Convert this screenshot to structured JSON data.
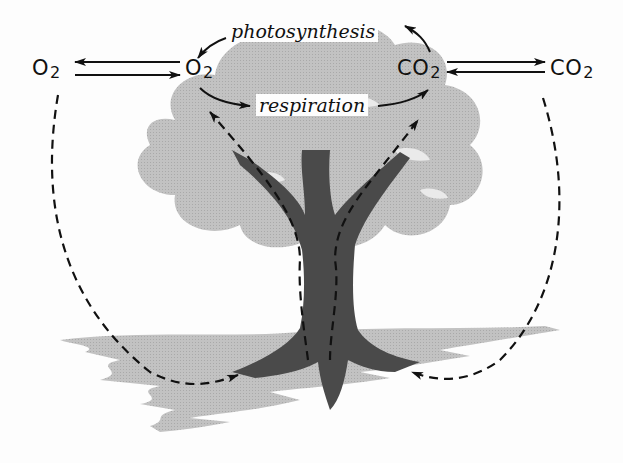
{
  "diagram": {
    "type": "gas exchange cycle in a tree",
    "labels": {
      "o2_atmosphere": {
        "base": "O",
        "sub": "2"
      },
      "o2_leaf": {
        "base": "O",
        "sub": "2"
      },
      "co2_leaf": {
        "base": "CO",
        "sub": "2"
      },
      "co2_atmosphere": {
        "base": "CO",
        "sub": "2"
      },
      "photosynthesis": "photosynthesis",
      "respiration": "respiration"
    },
    "colors": {
      "ink": "#111111",
      "foliage": "#bdbdbd",
      "trunk": "#4a4a4a",
      "ground": "#c6c6c6",
      "background": "#fdfdfd"
    },
    "flows": [
      {
        "from": "O2 (leaf)",
        "to": "O2 (atmosphere)",
        "style": "solid"
      },
      {
        "from": "O2 (atmosphere)",
        "to": "O2 (leaf)",
        "style": "solid"
      },
      {
        "from": "CO2 (leaf)",
        "to": "CO2 (atmosphere)",
        "style": "solid"
      },
      {
        "from": "CO2 (atmosphere)",
        "to": "CO2 (leaf)",
        "style": "solid"
      },
      {
        "from": "CO2 (leaf)",
        "to": "photosynthesis",
        "style": "solid"
      },
      {
        "from": "photosynthesis",
        "to": "O2 (leaf)",
        "style": "solid"
      },
      {
        "from": "O2 (leaf)",
        "to": "respiration",
        "style": "solid"
      },
      {
        "from": "respiration",
        "to": "CO2 (leaf)",
        "style": "solid"
      },
      {
        "from": "O2 (atmosphere)",
        "to": "roots (left)",
        "style": "dashed"
      },
      {
        "from": "CO2 (atmosphere)",
        "to": "roots (right)",
        "style": "dashed"
      },
      {
        "from": "roots",
        "to": "leaves via trunk",
        "style": "dashed"
      }
    ]
  }
}
